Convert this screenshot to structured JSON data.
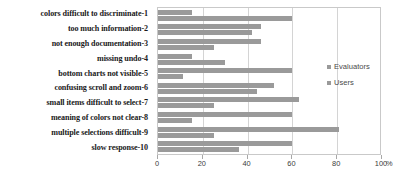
{
  "chart_data": {
    "type": "bar",
    "orientation": "horizontal",
    "title": "",
    "xlabel": "%",
    "ylabel": "",
    "xlim": [
      0,
      100
    ],
    "xticks": [
      0,
      20,
      40,
      60,
      80,
      100
    ],
    "xtick_labels": [
      "0",
      "20",
      "40",
      "60",
      "80",
      "100"
    ],
    "axis_unit": "%",
    "grid": true,
    "grid_axis": "x",
    "legend_position": "right",
    "categories": [
      "colors difficult to discriminate-1",
      "too much information-2",
      "not enough documentation-3",
      "missing undo-4",
      "bottom charts not visible-5",
      "confusing scroll and zoom-6",
      "small items difficult to select-7",
      "meaning of colors not clear-8",
      "multiple selections difficult-9",
      "slow response-10"
    ],
    "series": [
      {
        "name": "Evaluators",
        "color": "#9a9a9a",
        "values": [
          15,
          46,
          46,
          15,
          60,
          52,
          63,
          60,
          81,
          60
        ]
      },
      {
        "name": "Users",
        "color": "#9a9a9a",
        "values": [
          60,
          42,
          25,
          30,
          11,
          44,
          25,
          15,
          25,
          36
        ]
      }
    ]
  },
  "legend": {
    "items": [
      {
        "label": "Evaluators"
      },
      {
        "label": "Users"
      }
    ]
  }
}
